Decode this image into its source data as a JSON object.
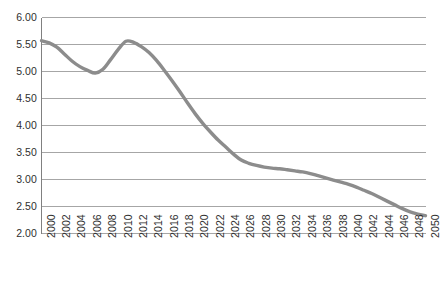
{
  "chart_data": {
    "type": "line",
    "title": "",
    "subtitle": "",
    "xlabel": "",
    "ylabel": "",
    "grid": true,
    "legend": false,
    "legend_position": "none",
    "line_color": "#8c8c8c",
    "grid_color": "#a6a6a6",
    "axis_color": "#808080",
    "text_color": "#2f2f2f",
    "background_color": "#ffffff",
    "xlim": [
      2000,
      2050
    ],
    "ylim": [
      2.0,
      6.0
    ],
    "yticks": [
      "6.00",
      "5.50",
      "5.00",
      "4.50",
      "4.00",
      "3.50",
      "3.00",
      "2.50",
      "2.00"
    ],
    "ytick_values": [
      6.0,
      5.5,
      5.0,
      4.5,
      4.0,
      3.5,
      3.0,
      2.5,
      2.0
    ],
    "xticks": [
      "2000",
      "2002",
      "2004",
      "2006",
      "2008",
      "2010",
      "2012",
      "2014",
      "2016",
      "2018",
      "2020",
      "2022",
      "2024",
      "2026",
      "2028",
      "2030",
      "2032",
      "2034",
      "2036",
      "2038",
      "2040",
      "2042",
      "2044",
      "2046",
      "2048",
      "2050"
    ],
    "xtick_rotation": -90,
    "x": [
      2000,
      2001,
      2002,
      2003,
      2004,
      2005,
      2006,
      2007,
      2008,
      2009,
      2010,
      2011,
      2012,
      2013,
      2014,
      2015,
      2016,
      2017,
      2018,
      2019,
      2020,
      2021,
      2022,
      2023,
      2024,
      2025,
      2026,
      2027,
      2028,
      2029,
      2030,
      2031,
      2032,
      2033,
      2034,
      2035,
      2036,
      2037,
      2038,
      2039,
      2040,
      2041,
      2042,
      2043,
      2044,
      2045,
      2046,
      2047,
      2048,
      2049,
      2050
    ],
    "series": [
      {
        "name": "",
        "values": [
          5.57,
          5.53,
          5.45,
          5.32,
          5.19,
          5.09,
          5.02,
          4.97,
          5.04,
          5.22,
          5.41,
          5.56,
          5.54,
          5.46,
          5.35,
          5.2,
          5.02,
          4.83,
          4.63,
          4.42,
          4.22,
          4.04,
          3.88,
          3.73,
          3.6,
          3.47,
          3.36,
          3.3,
          3.26,
          3.23,
          3.21,
          3.2,
          3.18,
          3.16,
          3.14,
          3.11,
          3.07,
          3.03,
          2.99,
          2.95,
          2.91,
          2.86,
          2.8,
          2.74,
          2.67,
          2.6,
          2.53,
          2.46,
          2.4,
          2.36,
          2.33
        ]
      }
    ],
    "peaks": {
      "start_value": 5.57,
      "local_min_year": 2007,
      "local_min_value": 4.97,
      "local_max_year": 2011,
      "local_max_value": 5.56,
      "end_year": 2050,
      "end_value": 2.33
    }
  }
}
